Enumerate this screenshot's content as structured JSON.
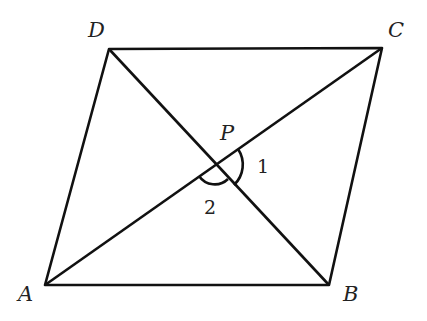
{
  "diagram": {
    "type": "parallelogram-with-diagonals",
    "stroke_color": "#111111",
    "vertices": [
      {
        "id": "A",
        "label": "A",
        "x": 45,
        "y": 285
      },
      {
        "id": "B",
        "label": "B",
        "x": 329,
        "y": 285
      },
      {
        "id": "C",
        "label": "C",
        "x": 382,
        "y": 48
      },
      {
        "id": "D",
        "label": "D",
        "x": 109,
        "y": 49
      }
    ],
    "intersection": {
      "label": "P",
      "x": 215,
      "y": 165
    },
    "angles": [
      {
        "label": "1",
        "between": [
          "PC",
          "PB"
        ]
      },
      {
        "label": "2",
        "between": [
          "PA",
          "PB"
        ]
      }
    ]
  }
}
